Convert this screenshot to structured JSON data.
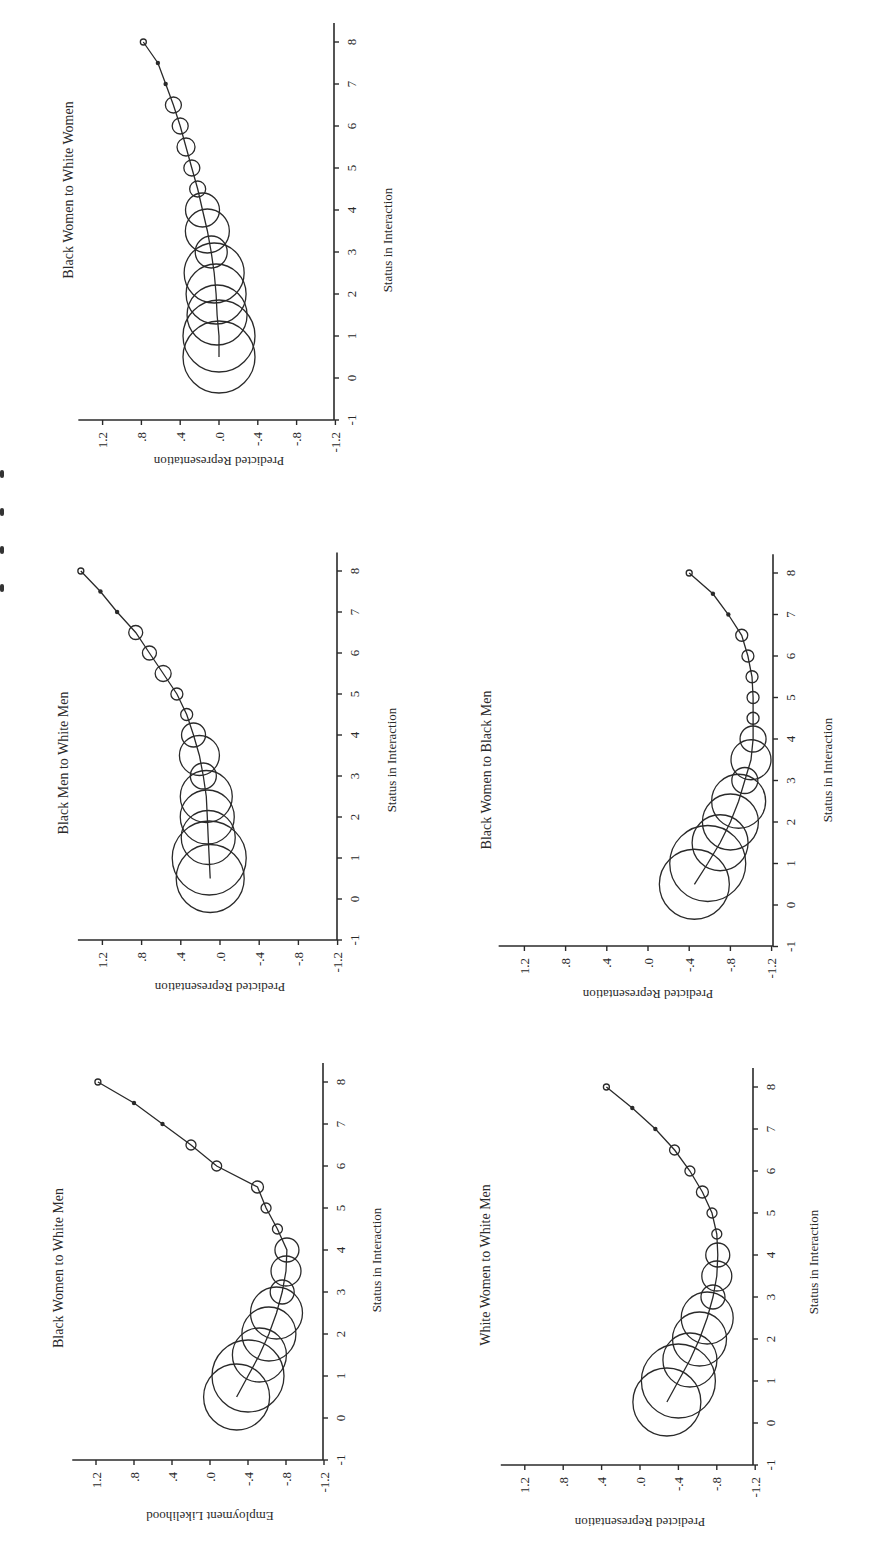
{
  "figure": {
    "orientation": "rotated-90-ccw",
    "ink_color": "#2a2a2a",
    "background": "#ffffff",
    "caption_fragment": "clipped at left edge (unreadable)"
  },
  "chart_data": [
    {
      "type": "scatter",
      "subtype": "bubble-with-fitted-curve",
      "title": "Black Women to White Women",
      "xlabel": "Status in Interaction",
      "ylabel": "Predicted Representation",
      "xlim": [
        -1,
        8.4
      ],
      "ylim": [
        -1.2,
        1.4
      ],
      "x_ticks": [
        "-1",
        "0",
        "1",
        "2",
        "3",
        "4",
        "5",
        "6",
        "7",
        "8"
      ],
      "y_ticks": [
        "1.2",
        ".8",
        ".4",
        ".0",
        "-.4",
        "-.8",
        "-1.2"
      ],
      "x": [
        0.5,
        1,
        1.5,
        2,
        2.5,
        3,
        3.5,
        4,
        4.5,
        5,
        5.5,
        6,
        6.5,
        7,
        7.5,
        8
      ],
      "values": [
        0.0,
        0.0,
        0.02,
        0.03,
        0.05,
        0.08,
        0.12,
        0.17,
        0.22,
        0.28,
        0.34,
        0.4,
        0.47,
        0.55,
        0.63,
        0.78
      ],
      "bubble_radius_px": [
        36,
        36,
        30,
        30,
        30,
        16,
        22,
        17,
        8,
        8,
        9,
        8,
        8,
        2,
        2,
        3
      ],
      "grid": false
    },
    {
      "type": "scatter",
      "subtype": "bubble-with-fitted-curve",
      "title": "Black Men to White Men",
      "xlabel": "Status in Interaction",
      "ylabel": "Predicted Representation",
      "xlim": [
        -1,
        8.4
      ],
      "ylim": [
        -1.2,
        1.4
      ],
      "x_ticks": [
        "-1",
        "0",
        "1",
        "2",
        "3",
        "4",
        "5",
        "6",
        "7",
        "8"
      ],
      "y_ticks": [
        "1.2",
        ".8",
        ".4",
        ".0",
        "-.4",
        "-.8",
        "-1.2"
      ],
      "x": [
        0.5,
        1,
        1.5,
        2,
        2.5,
        3,
        3.5,
        4,
        4.5,
        5,
        5.5,
        6,
        6.5,
        7,
        7.5,
        8
      ],
      "values": [
        0.1,
        0.11,
        0.12,
        0.13,
        0.14,
        0.17,
        0.21,
        0.27,
        0.34,
        0.44,
        0.58,
        0.72,
        0.86,
        1.05,
        1.22,
        1.42
      ],
      "bubble_radius_px": [
        34,
        37,
        27,
        27,
        26,
        13,
        20,
        12,
        6,
        6,
        8,
        7,
        7,
        2,
        2,
        3
      ],
      "grid": false
    },
    {
      "type": "scatter",
      "subtype": "bubble-with-fitted-curve",
      "title": "Black Women to Black Men",
      "xlabel": "Status in Interaction",
      "ylabel": "Predicted Representation",
      "xlim": [
        -1,
        8.4
      ],
      "ylim": [
        -1.2,
        1.4
      ],
      "x_ticks": [
        "-1",
        "0",
        "1",
        "2",
        "3",
        "4",
        "5",
        "6",
        "7",
        "8"
      ],
      "y_ticks": [
        "1.2",
        ".8",
        ".4",
        ".0",
        "-.4",
        "-.8",
        "-1.2"
      ],
      "x": [
        0.5,
        1,
        1.5,
        2,
        2.5,
        3,
        3.5,
        4,
        4.5,
        5,
        5.5,
        6,
        6.5,
        7,
        7.5,
        8
      ],
      "values": [
        -0.45,
        -0.58,
        -0.7,
        -0.8,
        -0.88,
        -0.94,
        -1.0,
        -1.02,
        -1.02,
        -1.02,
        -1.01,
        -0.97,
        -0.91,
        -0.78,
        -0.63,
        -0.4
      ],
      "bubble_radius_px": [
        35,
        38,
        28,
        28,
        27,
        13,
        20,
        13,
        6,
        6,
        6,
        6,
        6,
        2,
        2,
        3
      ],
      "grid": false
    },
    {
      "type": "scatter",
      "subtype": "bubble-with-fitted-curve",
      "title": "Black Women to White Men",
      "xlabel": "Status in Interaction",
      "ylabel": "Employment Likelihood",
      "xlim": [
        -1,
        8.4
      ],
      "ylim": [
        -1.2,
        1.4
      ],
      "x_ticks": [
        "-1",
        "0",
        "1",
        "2",
        "3",
        "4",
        "5",
        "6",
        "7",
        "8"
      ],
      "y_ticks": [
        "1.2",
        ".8",
        ".4",
        ".0",
        "-.4",
        "-.8",
        "-1.2"
      ],
      "x": [
        0.5,
        1,
        1.5,
        2,
        2.5,
        3,
        3.5,
        4,
        4.5,
        5,
        5.5,
        6,
        6.5,
        7,
        7.5,
        8
      ],
      "values": [
        -0.28,
        -0.4,
        -0.52,
        -0.62,
        -0.7,
        -0.76,
        -0.8,
        -0.81,
        -0.71,
        -0.59,
        -0.5,
        -0.07,
        0.2,
        0.5,
        0.8,
        1.18
      ],
      "bubble_radius_px": [
        33,
        36,
        27,
        27,
        26,
        12,
        15,
        12,
        5,
        5,
        6,
        5,
        5,
        2,
        2,
        3
      ],
      "grid": false
    },
    {
      "type": "scatter",
      "subtype": "bubble-with-fitted-curve",
      "title": "White Women to White Men",
      "xlabel": "Status in Interaction",
      "ylabel": "Predicted Representation",
      "xlim": [
        -1,
        8.4
      ],
      "ylim": [
        -1.2,
        1.4
      ],
      "x_ticks": [
        "-1",
        "0",
        "1",
        "2",
        "3",
        "4",
        "5",
        "6",
        "7",
        "8"
      ],
      "y_ticks": [
        "1.2",
        ".8",
        ".4",
        ".0",
        "-.4",
        "-.8",
        "-1.2"
      ],
      "x": [
        0.5,
        1,
        1.5,
        2,
        2.5,
        3,
        3.5,
        4,
        4.5,
        5,
        5.5,
        6,
        6.5,
        7,
        7.5,
        8
      ],
      "values": [
        -0.28,
        -0.4,
        -0.52,
        -0.62,
        -0.7,
        -0.76,
        -0.8,
        -0.81,
        -0.8,
        -0.75,
        -0.65,
        -0.52,
        -0.36,
        -0.16,
        0.08,
        0.35
      ],
      "bubble_radius_px": [
        34,
        37,
        27,
        27,
        26,
        12,
        15,
        12,
        5,
        5,
        6,
        5,
        5,
        2,
        2,
        3
      ],
      "grid": false
    }
  ],
  "panels_layout": [
    {
      "axis_y": 420,
      "v_zero_x": 219,
      "v_scale": 97,
      "s_axis_x": 334,
      "s_zero_y": 378,
      "s_scale": 42,
      "title_x": 73,
      "title_y_center": 190,
      "ylabel_y": 457,
      "xlabel_x": 392,
      "xlabel_y_center": 240
    },
    {
      "axis_y": 940,
      "v_zero_x": 220,
      "v_scale": 98,
      "s_axis_x": 337,
      "s_zero_y": 899,
      "s_scale": 41,
      "title_x": 68,
      "title_y_center": 763,
      "ylabel_y": 983,
      "xlabel_x": 396,
      "xlabel_y_center": 760
    },
    {
      "axis_y": 946,
      "v_zero_x": 648,
      "v_scale": 103,
      "s_axis_x": 773,
      "s_zero_y": 905,
      "s_scale": 41.5,
      "title_x": 491,
      "title_y_center": 770,
      "ylabel_y": 990,
      "xlabel_x": 832,
      "xlabel_y_center": 770
    },
    {
      "axis_y": 1460,
      "v_zero_x": 210,
      "v_scale": 95,
      "s_axis_x": 323,
      "s_zero_y": 1418,
      "s_scale": 42,
      "title_x": 63,
      "title_y_center": 1268,
      "ylabel_y": 1512,
      "xlabel_x": 381,
      "xlabel_y_center": 1260
    },
    {
      "axis_y": 1465,
      "v_zero_x": 640,
      "v_scale": 96,
      "s_axis_x": 753,
      "s_zero_y": 1423,
      "s_scale": 42,
      "title_x": 490,
      "title_y_center": 1265,
      "ylabel_y": 1518,
      "xlabel_x": 818,
      "xlabel_y_center": 1262
    }
  ]
}
